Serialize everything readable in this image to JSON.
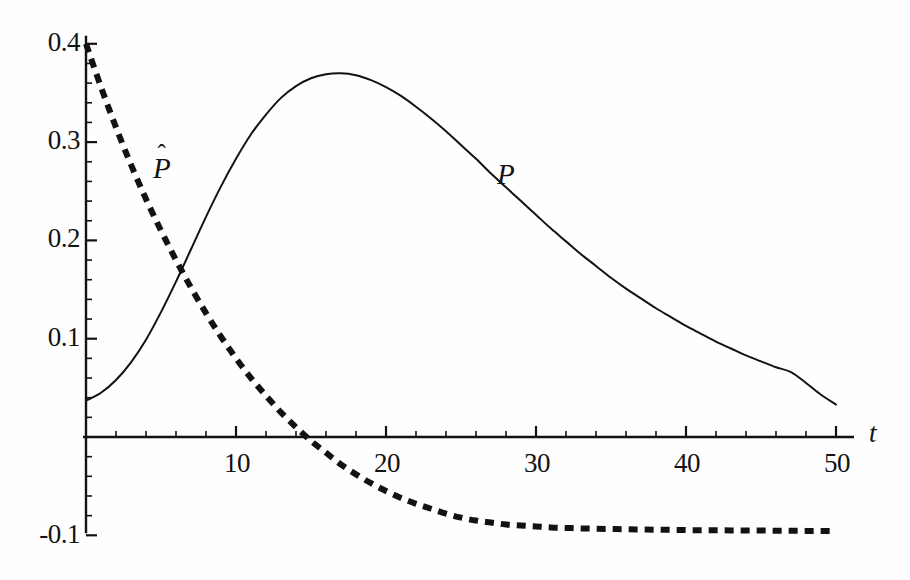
{
  "figure": {
    "background_color": "#fefefe",
    "ink_color": "#121212",
    "width": 910,
    "height": 580
  },
  "axes": {
    "x_axis_label": "t",
    "y_axis_label": "",
    "x_origin_px": 86,
    "y_origin_px": 437,
    "px_per_t": 15.0,
    "px_per_unit_y": 983.0,
    "x_tick_labels": [
      "10",
      "20",
      "30",
      "40",
      "50"
    ],
    "y_tick_labels": [
      "0.4",
      "0.3",
      "0.2",
      "0.1",
      "-0.1"
    ]
  },
  "labels": {
    "p_label": "P",
    "phat_base": "P",
    "phat_hat": "ˆ"
  },
  "chart_data": {
    "type": "line",
    "title": "",
    "subtitle": "",
    "xlabel": "t",
    "ylabel": "",
    "xlim": [
      0,
      50
    ],
    "ylim": [
      -0.1,
      0.4
    ],
    "grid": false,
    "legend": "inline-curve-labels",
    "annotations": [
      {
        "text": "P̂",
        "t": 6.0,
        "value": 0.26,
        "target": "phat-curve"
      },
      {
        "text": "P",
        "t": 28.0,
        "value": 0.275,
        "target": "p-curve"
      }
    ],
    "x_ticks_major": [
      0,
      10,
      20,
      30,
      40,
      50
    ],
    "x_ticks_minor_step": 2,
    "y_ticks_major": [
      -0.1,
      0,
      0.1,
      0.2,
      0.3,
      0.4
    ],
    "y_ticks_minor_step": 0.02,
    "series": [
      {
        "name": "P",
        "style": "solid",
        "linewidth_px": 2,
        "color": "#121212",
        "x": [
          0,
          1,
          2,
          3,
          4,
          5,
          6,
          7,
          8,
          9,
          10,
          11,
          12,
          13,
          14,
          15,
          16,
          17,
          18,
          19,
          20,
          21,
          22,
          23,
          24,
          25,
          26,
          27,
          28,
          29,
          30,
          31,
          32,
          33,
          34,
          35,
          36,
          37,
          38,
          39,
          40,
          41,
          42,
          43,
          44,
          45,
          46,
          47,
          48,
          49,
          50
        ],
        "values": [
          0.037,
          0.045,
          0.058,
          0.076,
          0.099,
          0.127,
          0.158,
          0.191,
          0.224,
          0.255,
          0.283,
          0.308,
          0.328,
          0.345,
          0.357,
          0.365,
          0.369,
          0.37,
          0.368,
          0.363,
          0.356,
          0.347,
          0.336,
          0.324,
          0.311,
          0.297,
          0.283,
          0.268,
          0.254,
          0.24,
          0.226,
          0.212,
          0.199,
          0.186,
          0.174,
          0.162,
          0.151,
          0.141,
          0.131,
          0.122,
          0.113,
          0.105,
          0.097,
          0.09,
          0.083,
          0.077,
          0.071,
          0.066,
          0.055,
          0.043,
          0.033
        ]
      },
      {
        "name": "P̂",
        "style": "dashed",
        "linewidth_px": 6,
        "dash_px": [
          9,
          7
        ],
        "color": "#121212",
        "x": [
          0,
          1,
          2,
          3,
          4,
          5,
          6,
          7,
          8,
          9,
          10,
          11,
          12,
          13,
          14,
          15,
          16,
          17,
          18,
          19,
          20,
          21,
          22,
          23,
          24,
          25,
          26,
          27,
          28,
          29,
          30,
          31,
          32,
          33,
          34,
          35,
          36,
          37,
          38,
          39,
          40,
          41,
          42,
          43,
          44,
          45,
          46,
          47,
          48,
          49,
          50
        ],
        "values": [
          0.4,
          0.356,
          0.315,
          0.277,
          0.242,
          0.21,
          0.18,
          0.152,
          0.126,
          0.102,
          0.08,
          0.06,
          0.042,
          0.025,
          0.01,
          -0.004,
          -0.016,
          -0.028,
          -0.038,
          -0.047,
          -0.055,
          -0.062,
          -0.068,
          -0.073,
          -0.078,
          -0.082,
          -0.085,
          -0.087,
          -0.089,
          -0.09,
          -0.091,
          -0.092,
          -0.0925,
          -0.093,
          -0.0933,
          -0.0936,
          -0.0939,
          -0.0941,
          -0.0943,
          -0.0945,
          -0.0947,
          -0.0948,
          -0.0949,
          -0.095,
          -0.0951,
          -0.0952,
          -0.0953,
          -0.0954,
          -0.0955,
          -0.0955,
          -0.0956
        ]
      }
    ]
  }
}
